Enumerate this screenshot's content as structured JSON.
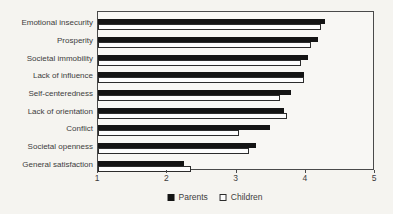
{
  "figure": {
    "background": "#f5f4f0",
    "plot_border_color": "#4a4a4a",
    "text_color": "#3d3d3d"
  },
  "chart_data": {
    "type": "bar",
    "orientation": "horizontal",
    "title": "",
    "xlabel": "",
    "ylabel": "",
    "categories": [
      "Emotional insecurity",
      "Prosperity",
      "Societal immobility",
      "Lack of influence",
      "Self-centeredness",
      "Lack of orientation",
      "Conflict",
      "Societal openness",
      "General satisfaction"
    ],
    "series": [
      {
        "name": "Parents",
        "color": "#141414",
        "values": [
          4.3,
          4.2,
          4.05,
          4.0,
          3.8,
          3.7,
          3.5,
          3.3,
          2.25
        ]
      },
      {
        "name": "Children",
        "color": "#ffffff",
        "values": [
          4.25,
          4.1,
          3.95,
          4.0,
          3.65,
          3.75,
          3.05,
          3.2,
          2.35
        ]
      }
    ],
    "xlim": [
      1,
      5
    ],
    "x_ticks": [
      "1",
      "2",
      "3",
      "4",
      "5"
    ],
    "grid": false,
    "legend_position": "bottom"
  }
}
